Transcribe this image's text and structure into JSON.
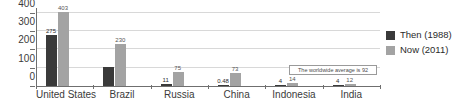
{
  "top_strip": {
    "clipped_text": ""
  },
  "chart_data": {
    "type": "bar",
    "title": "",
    "subtitle": "",
    "xlabel": "",
    "ylabel": "",
    "ylim": [
      0,
      430
    ],
    "yticks": [
      0,
      100,
      200,
      300,
      400
    ],
    "ytick_labels": [
      "0",
      "100",
      "200",
      "300",
      "400"
    ],
    "grid": true,
    "legend_position": "right",
    "categories": [
      "United States",
      "Brazil",
      "Russia",
      "China",
      "Indonesia",
      "India"
    ],
    "series": [
      {
        "name": "Then (1988)",
        "color": "#3a3a3a",
        "values": [
          275,
          105,
          11,
          0.48,
          4,
          4
        ],
        "value_labels": [
          "275",
          "",
          "11",
          "0.48",
          "4",
          "4"
        ]
      },
      {
        "name": "Now (2011)",
        "color": "#a3a3a3",
        "values": [
          403,
          230,
          75,
          73,
          14,
          12
        ],
        "value_labels": [
          "403",
          "230",
          "75",
          "73",
          "14",
          "12"
        ]
      }
    ],
    "annotation": "The worldwide average is 92"
  },
  "legend": {
    "items": [
      {
        "label": "Then (1988)",
        "color": "#3a3a3a"
      },
      {
        "label": "Now (2011)",
        "color": "#a3a3a3"
      }
    ]
  }
}
